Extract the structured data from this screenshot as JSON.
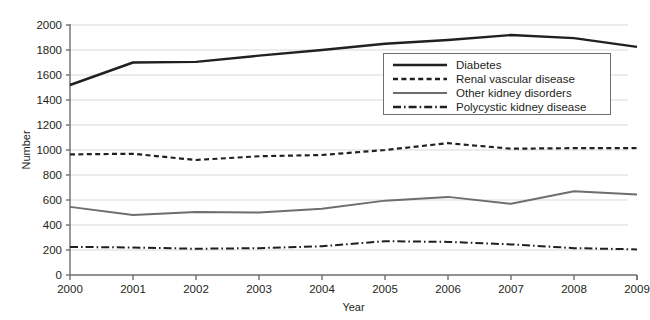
{
  "chart_data": {
    "type": "line",
    "title": "",
    "xlabel": "Year",
    "ylabel": "Number",
    "categories": [
      2000,
      2001,
      2002,
      2003,
      2004,
      2005,
      2006,
      2007,
      2008,
      2009
    ],
    "x": [
      "2000",
      "2001",
      "2002",
      "2003",
      "2004",
      "2005",
      "2006",
      "2007",
      "2008",
      "2009"
    ],
    "xlim": [
      2000,
      2009
    ],
    "ylim": [
      0,
      2000
    ],
    "yticks": [
      0,
      200,
      400,
      600,
      800,
      1000,
      1200,
      1400,
      1600,
      1800,
      2000
    ],
    "ytick_labels": [
      "0",
      "200",
      "400",
      "600",
      "800",
      "1000",
      "1200",
      "1400",
      "1600",
      "1800",
      "2000"
    ],
    "grid": true,
    "grid_axis": "y",
    "legend_position": "inside-upper-right",
    "series": [
      {
        "name": "Diabetes",
        "style": "solid",
        "color": "#231f20",
        "width": 2.4,
        "values": [
          1520,
          1700,
          1705,
          1755,
          1800,
          1850,
          1880,
          1920,
          1895,
          1825
        ]
      },
      {
        "name": "Renal vascular disease",
        "style": "dashed",
        "color": "#231f20",
        "width": 2.2,
        "values": [
          965,
          970,
          920,
          950,
          960,
          1000,
          1055,
          1010,
          1015,
          1015
        ]
      },
      {
        "name": "Other kidney disorders",
        "style": "solid",
        "color": "#6d6e71",
        "width": 2.0,
        "values": [
          545,
          480,
          505,
          500,
          530,
          595,
          625,
          570,
          670,
          645
        ]
      },
      {
        "name": "Polycystic kidney disease",
        "style": "dashdot",
        "color": "#231f20",
        "width": 2.0,
        "values": [
          225,
          220,
          210,
          215,
          230,
          270,
          265,
          245,
          215,
          205
        ]
      }
    ]
  }
}
